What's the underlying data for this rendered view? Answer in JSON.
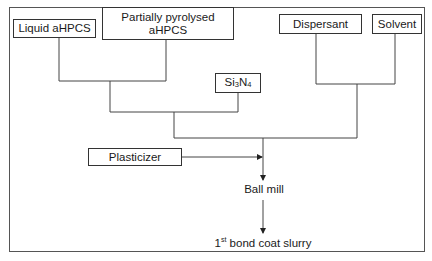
{
  "diagram": {
    "type": "flowchart",
    "title": "",
    "nodes": {
      "liquid_ahpcs": "Liquid aHPCS",
      "partially_pyrolysed_line1": "Partially pyrolysed",
      "partially_pyrolysed_line2": "aHPCS",
      "si3n4_base": "Si",
      "si3n4_sub1": "3",
      "si3n4_mid": "N",
      "si3n4_sub2": "4",
      "dispersant": "Dispersant",
      "solvent": "Solvent",
      "plasticizer": "Plasticizer",
      "ball_mill": "Ball mill",
      "slurry_num": "1",
      "slurry_sup": "st",
      "slurry_rest": " bond coat slurry"
    },
    "edges": [
      {
        "from": "Liquid aHPCS",
        "to": "join-1"
      },
      {
        "from": "Partially pyrolysed aHPCS",
        "to": "join-1"
      },
      {
        "from": "join-1",
        "to": "join-2"
      },
      {
        "from": "Si3N4",
        "to": "join-2"
      },
      {
        "from": "Dispersant",
        "to": "join-3"
      },
      {
        "from": "Solvent",
        "to": "join-3"
      },
      {
        "from": "join-2",
        "to": "join-4"
      },
      {
        "from": "join-3",
        "to": "join-4"
      },
      {
        "from": "Plasticizer",
        "to": "join-4"
      },
      {
        "from": "join-4",
        "to": "Ball mill"
      },
      {
        "from": "Ball mill",
        "to": "1st bond coat slurry"
      }
    ],
    "colors": {
      "line": "#333333",
      "background": "#ffffff"
    }
  }
}
